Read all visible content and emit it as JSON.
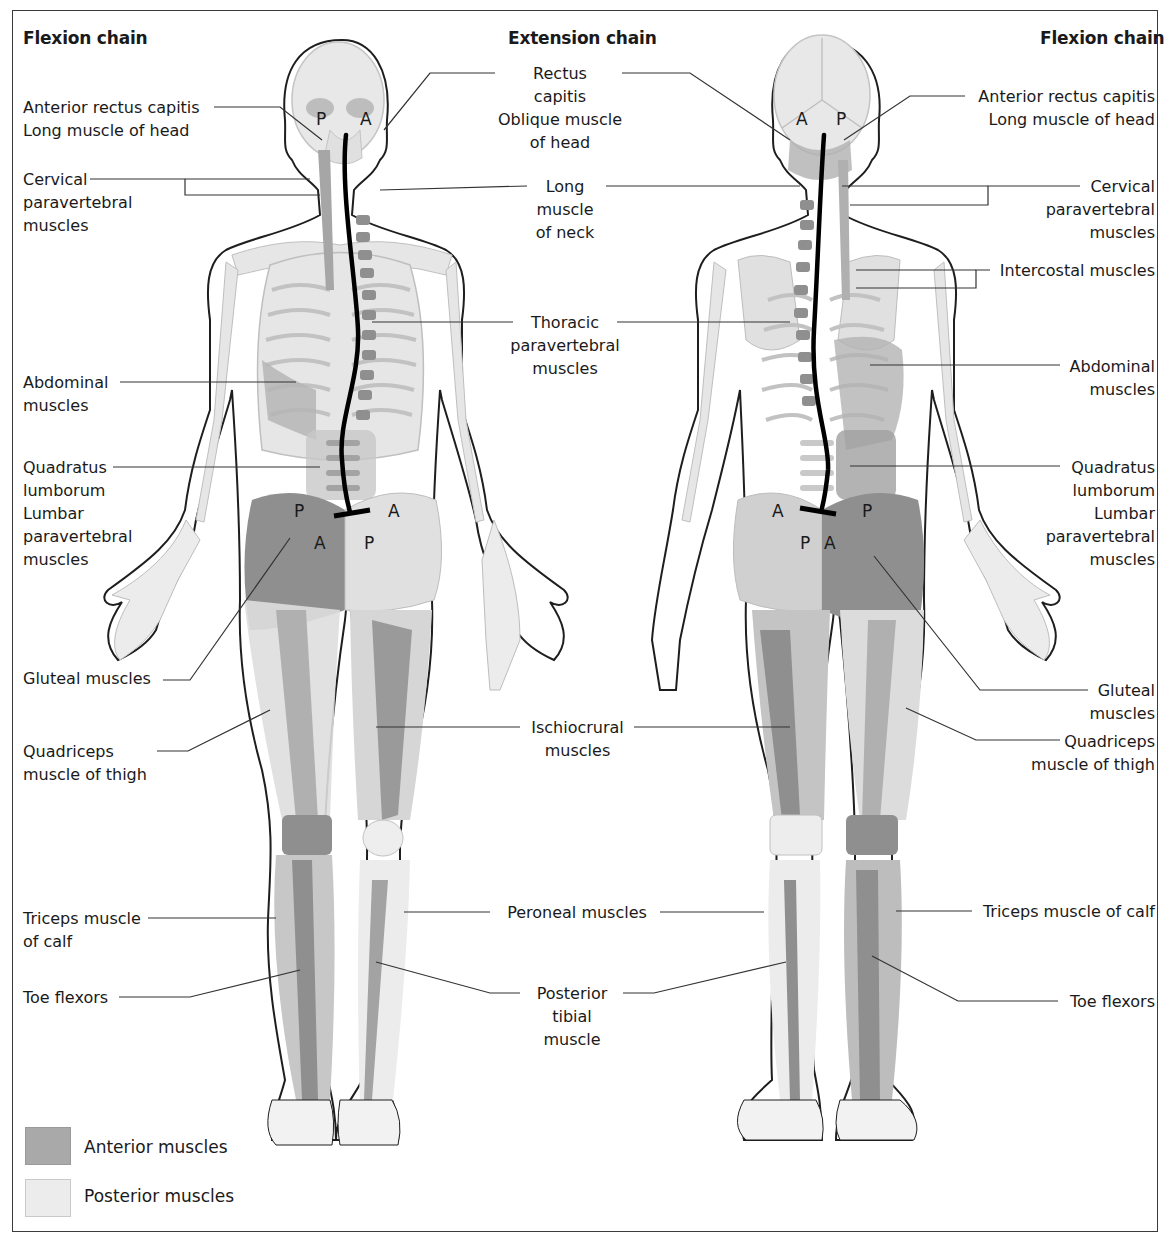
{
  "titles": {
    "left": "Flexion chain",
    "center": "Extension chain",
    "right": "Flexion chain"
  },
  "markers": {
    "posterior": "P",
    "anterior": "A"
  },
  "labels_left": [
    {
      "id": "anterior-rectus-capitis",
      "text": "Anterior rectus capitis\nLong muscle of head"
    },
    {
      "id": "cervical-paravertebral",
      "text": "Cervical\nparavertebral\nmuscles"
    },
    {
      "id": "abdominal",
      "text": "Abdominal\nmuscles"
    },
    {
      "id": "quadratus-lumborum",
      "text": "Quadratus\nlumborum\nLumbar\nparavertebral\nmuscles"
    },
    {
      "id": "gluteal",
      "text": "Gluteal muscles"
    },
    {
      "id": "quadriceps",
      "text": "Quadriceps\nmuscle of thigh"
    },
    {
      "id": "triceps-calf",
      "text": "Triceps muscle\nof calf"
    },
    {
      "id": "toe-flexors",
      "text": "Toe flexors"
    }
  ],
  "labels_center": [
    {
      "id": "rectus-capitis",
      "text": "Rectus\ncapitis\nOblique muscle\nof head"
    },
    {
      "id": "long-muscle-neck",
      "text": "Long\nmuscle\nof neck"
    },
    {
      "id": "thoracic-paravertebral",
      "text": "Thoracic\nparavertebral\nmuscles"
    },
    {
      "id": "ischiocrural",
      "text": "Ischiocrural\nmuscles"
    },
    {
      "id": "peroneal",
      "text": "Peroneal muscles"
    },
    {
      "id": "posterior-tibial",
      "text": "Posterior\ntibial\nmuscle"
    }
  ],
  "labels_right": [
    {
      "id": "anterior-rectus-capitis",
      "text": "Anterior rectus capitis\nLong muscle of head"
    },
    {
      "id": "cervical-paravertebral",
      "text": "Cervical\nparavertebral\nmuscles"
    },
    {
      "id": "intercostal",
      "text": "Intercostal muscles"
    },
    {
      "id": "abdominal",
      "text": "Abdominal\nmuscles"
    },
    {
      "id": "quadratus-lumborum",
      "text": "Quadratus\nlumborum\nLumbar\nparavertebral\nmuscles"
    },
    {
      "id": "gluteal",
      "text": "Gluteal\nmuscles"
    },
    {
      "id": "quadriceps",
      "text": "Quadriceps\nmuscle of thigh"
    },
    {
      "id": "triceps-calf",
      "text": "Triceps muscle of calf"
    },
    {
      "id": "toe-flexors",
      "text": "Toe flexors"
    }
  ],
  "legend": [
    {
      "label": "Anterior muscles",
      "color": "#a9a9a9"
    },
    {
      "label": "Posterior muscles",
      "color": "#ececec"
    }
  ],
  "colors": {
    "outline": "#1e1e1e",
    "bone": "#e6e6e6",
    "bone_stroke": "#b9b9b9",
    "anterior": "#8f8f8f",
    "posterior": "#cfcfcf",
    "chain_line": "#000000"
  }
}
